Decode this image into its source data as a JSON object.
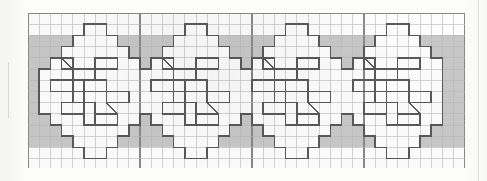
{
  "document": {
    "kind": "graph-paper-chart",
    "title": "Repeating diamond medallion border chart",
    "medium": "scanned squared paper"
  },
  "colors": {
    "paper": "#fcfcfa",
    "plate": "#ffffff",
    "grid_minor": "#b9b9b9",
    "grid_major": "#8a8a8a",
    "band_fill": "#c4c4c4",
    "motif_stroke": "#5a5a5a",
    "motif_fill": "#ffffff",
    "margin_rule": "#dedede"
  },
  "grid": {
    "origin_x": 28,
    "origin_y": 13,
    "cell": 11.2,
    "cols": 39,
    "rows": 14,
    "major_every_cols": 10,
    "major_every_rows": 14,
    "minor_width": 0.6,
    "major_width": 1.1
  },
  "band": {
    "label": "shaded background band",
    "row_start": 2,
    "row_end": 12,
    "col_start": 0,
    "col_end": 39,
    "fill": "#c4c4c4"
  },
  "motif": {
    "label": "diamond medallion",
    "repeat_count": 4,
    "repeat_pitch_cols": 9,
    "first_origin_col": 1,
    "origin_row": 1,
    "width_cols": 9,
    "height_rows": 12,
    "stroke": "#5a5a5a",
    "fill": "#ffffff",
    "outline_cells": [
      [
        4,
        0
      ],
      [
        5,
        0
      ],
      [
        3,
        1
      ],
      [
        4,
        1
      ],
      [
        5,
        1
      ],
      [
        6,
        1
      ],
      [
        2,
        2
      ],
      [
        3,
        2
      ],
      [
        4,
        2
      ],
      [
        5,
        2
      ],
      [
        6,
        2
      ],
      [
        7,
        2
      ],
      [
        1,
        3
      ],
      [
        2,
        3
      ],
      [
        3,
        3
      ],
      [
        4,
        3
      ],
      [
        5,
        3
      ],
      [
        6,
        3
      ],
      [
        7,
        3
      ],
      [
        8,
        3
      ],
      [
        0,
        4
      ],
      [
        1,
        4
      ],
      [
        2,
        4
      ],
      [
        3,
        4
      ],
      [
        4,
        4
      ],
      [
        5,
        4
      ],
      [
        6,
        4
      ],
      [
        7,
        4
      ],
      [
        8,
        4
      ],
      [
        0,
        5
      ],
      [
        1,
        5
      ],
      [
        2,
        5
      ],
      [
        3,
        5
      ],
      [
        4,
        5
      ],
      [
        5,
        5
      ],
      [
        6,
        5
      ],
      [
        7,
        5
      ],
      [
        8,
        5
      ],
      [
        0,
        6
      ],
      [
        1,
        6
      ],
      [
        2,
        6
      ],
      [
        3,
        6
      ],
      [
        4,
        6
      ],
      [
        5,
        6
      ],
      [
        6,
        6
      ],
      [
        7,
        6
      ],
      [
        8,
        6
      ],
      [
        0,
        7
      ],
      [
        1,
        7
      ],
      [
        2,
        7
      ],
      [
        3,
        7
      ],
      [
        4,
        7
      ],
      [
        5,
        7
      ],
      [
        6,
        7
      ],
      [
        7,
        7
      ],
      [
        8,
        7
      ],
      [
        1,
        8
      ],
      [
        2,
        8
      ],
      [
        3,
        8
      ],
      [
        4,
        8
      ],
      [
        5,
        8
      ],
      [
        6,
        8
      ],
      [
        7,
        8
      ],
      [
        8,
        8
      ],
      [
        2,
        9
      ],
      [
        3,
        9
      ],
      [
        4,
        9
      ],
      [
        5,
        9
      ],
      [
        6,
        9
      ],
      [
        7,
        9
      ],
      [
        3,
        10
      ],
      [
        4,
        10
      ],
      [
        5,
        10
      ],
      [
        6,
        10
      ],
      [
        4,
        11
      ],
      [
        5,
        11
      ]
    ],
    "inner_bars": [
      {
        "col": 2,
        "row": 3,
        "w": 1,
        "h": 1
      },
      {
        "col": 3,
        "row": 4,
        "w": 2,
        "h": 1
      },
      {
        "col": 5,
        "row": 3,
        "w": 2,
        "h": 1
      },
      {
        "col": 1,
        "row": 5,
        "w": 2,
        "h": 1
      },
      {
        "col": 3,
        "row": 6,
        "w": 1,
        "h": 1
      },
      {
        "col": 4,
        "row": 5,
        "w": 2,
        "h": 1
      },
      {
        "col": 6,
        "row": 6,
        "w": 2,
        "h": 1
      },
      {
        "col": 2,
        "row": 7,
        "w": 2,
        "h": 1
      },
      {
        "col": 4,
        "row": 7,
        "w": 1,
        "h": 2
      },
      {
        "col": 5,
        "row": 8,
        "w": 2,
        "h": 1
      }
    ],
    "diagonals": [
      {
        "col": 2,
        "row": 3,
        "dir": "tl-br"
      },
      {
        "col": 6,
        "row": 7,
        "dir": "tl-br"
      }
    ]
  },
  "legend": {
    "shaded_meaning": "background / filled mesh",
    "white_meaning": "motif / open mesh",
    "diagonal_meaning": "directional stitch"
  }
}
